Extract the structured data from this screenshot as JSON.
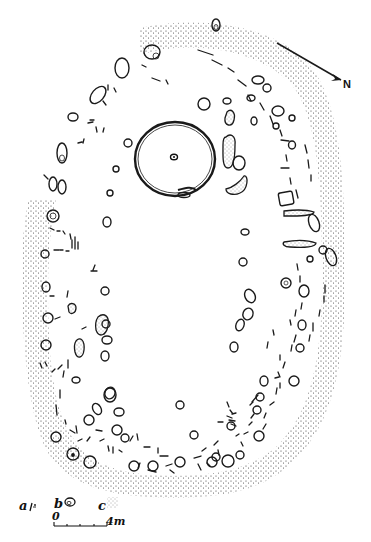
{
  "figure": {
    "type": "archaeological site plan",
    "north_arrow": {
      "label": "N"
    },
    "legend": [
      {
        "key": "a",
        "symbol": "stake-hole / short line marks"
      },
      {
        "key": "b",
        "symbol": "post-hole (double outline oval)"
      },
      {
        "key": "c",
        "symbol": "stippled area (bank / spread)"
      }
    ],
    "scale_bar": {
      "start_label": "0",
      "end_label": "4m"
    },
    "colors": {
      "ink": "#1a1a1a",
      "paper": "#ffffff",
      "stipple": "#333333"
    },
    "features": {
      "enclosure_shape": "oval ring of post-holes and stake-holes with stippled outer bank",
      "central_feature": "circular ring-ditch with central post-hole",
      "opening": "gap at bottom (south-west) of enclosure"
    }
  }
}
